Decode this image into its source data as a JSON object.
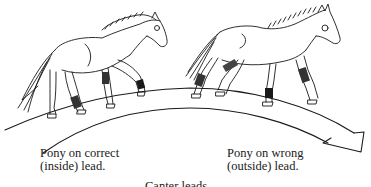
{
  "figure": {
    "title": "Canter leads",
    "colors": {
      "ink": "#1a1a1a",
      "background": "#ffffff"
    },
    "ponies": [
      {
        "id": "left-pony",
        "caption_line1": "Pony on correct",
        "caption_line2": "(inside) lead."
      },
      {
        "id": "right-pony",
        "caption_line1": "Pony on wrong",
        "caption_line2": "(outside) lead."
      }
    ],
    "path_arrow": {
      "direction": "left-to-right",
      "shape": "curved-band-arrow"
    }
  }
}
